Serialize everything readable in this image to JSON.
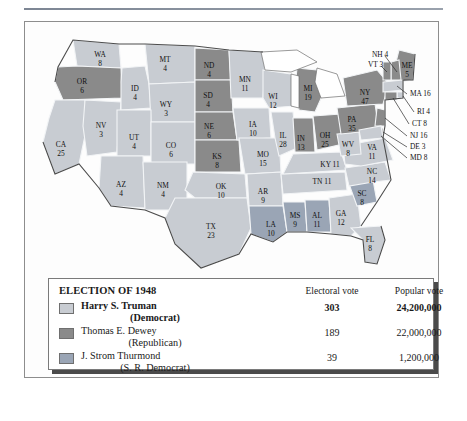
{
  "figure": {
    "legend_title": "ELECTION OF 1948",
    "col_electoral": "Electoral vote",
    "col_popular": "Popular vote",
    "candidates": [
      {
        "name": "Harry S. Truman",
        "party": "(Democrat)",
        "electoral": "303",
        "popular": "24,200,000",
        "color": "#c8ccd2"
      },
      {
        "name": "Thomas E. Dewey",
        "party": "(Republican)",
        "electoral": "189",
        "popular": "22,000,000",
        "color": "#8a8a8a"
      },
      {
        "name": "J. Strom Thurmond",
        "party": "(S. R. Democrat)",
        "electoral": "39",
        "popular": "1,200,000",
        "color": "#9aa5b5"
      }
    ]
  },
  "colors": {
    "truman": "#c8ccd2",
    "dewey": "#8a8a8a",
    "thurmond": "#9aa5b5",
    "water": "#ffffff",
    "border": "#f2f4f6",
    "coast": "#4c4c4c"
  },
  "chart_data": {
    "type": "map",
    "title": "ELECTION OF 1948",
    "legend_position": "bottom",
    "series": [
      {
        "name": "Harry S. Truman",
        "party": "Democrat",
        "electoral_vote": 303,
        "popular_vote": 24200000,
        "color": "#c8ccd2"
      },
      {
        "name": "Thomas E. Dewey",
        "party": "Republican",
        "electoral_vote": 189,
        "popular_vote": 22000000,
        "color": "#8a8a8a"
      },
      {
        "name": "J. Strom Thurmond",
        "party": "S. R. Democrat",
        "electoral_vote": 39,
        "popular_vote": 1200000,
        "color": "#9aa5b5"
      }
    ],
    "states": [
      {
        "code": "WA",
        "votes": 8,
        "winner": "truman"
      },
      {
        "code": "OR",
        "votes": 6,
        "winner": "dewey"
      },
      {
        "code": "CA",
        "votes": 25,
        "winner": "truman"
      },
      {
        "code": "NV",
        "votes": 3,
        "winner": "truman"
      },
      {
        "code": "ID",
        "votes": 4,
        "winner": "truman"
      },
      {
        "code": "MT",
        "votes": 4,
        "winner": "truman"
      },
      {
        "code": "WY",
        "votes": 3,
        "winner": "truman"
      },
      {
        "code": "UT",
        "votes": 4,
        "winner": "truman"
      },
      {
        "code": "AZ",
        "votes": 4,
        "winner": "truman"
      },
      {
        "code": "CO",
        "votes": 6,
        "winner": "truman"
      },
      {
        "code": "NM",
        "votes": 4,
        "winner": "truman"
      },
      {
        "code": "ND",
        "votes": 4,
        "winner": "dewey"
      },
      {
        "code": "SD",
        "votes": 4,
        "winner": "dewey"
      },
      {
        "code": "NE",
        "votes": 6,
        "winner": "dewey"
      },
      {
        "code": "KS",
        "votes": 8,
        "winner": "dewey"
      },
      {
        "code": "OK",
        "votes": 10,
        "winner": "truman"
      },
      {
        "code": "TX",
        "votes": 23,
        "winner": "truman"
      },
      {
        "code": "MN",
        "votes": 11,
        "winner": "truman"
      },
      {
        "code": "IA",
        "votes": 10,
        "winner": "truman"
      },
      {
        "code": "MO",
        "votes": 15,
        "winner": "truman"
      },
      {
        "code": "AR",
        "votes": 9,
        "winner": "truman"
      },
      {
        "code": "LA",
        "votes": 10,
        "winner": "thurmond"
      },
      {
        "code": "WI",
        "votes": 12,
        "winner": "truman"
      },
      {
        "code": "IL",
        "votes": 28,
        "winner": "truman"
      },
      {
        "code": "MS",
        "votes": 9,
        "winner": "thurmond"
      },
      {
        "code": "AL",
        "votes": 11,
        "winner": "thurmond"
      },
      {
        "code": "TN",
        "votes": 11,
        "winner": "truman"
      },
      {
        "code": "KY",
        "votes": 11,
        "winner": "truman"
      },
      {
        "code": "IN",
        "votes": 13,
        "winner": "dewey"
      },
      {
        "code": "MI",
        "votes": 19,
        "winner": "dewey"
      },
      {
        "code": "OH",
        "votes": 25,
        "winner": "dewey"
      },
      {
        "code": "GA",
        "votes": 12,
        "winner": "truman"
      },
      {
        "code": "FL",
        "votes": 8,
        "winner": "truman"
      },
      {
        "code": "SC",
        "votes": 8,
        "winner": "thurmond"
      },
      {
        "code": "NC",
        "votes": 14,
        "winner": "truman"
      },
      {
        "code": "VA",
        "votes": 11,
        "winner": "truman"
      },
      {
        "code": "WV",
        "votes": 8,
        "winner": "truman"
      },
      {
        "code": "PA",
        "votes": 35,
        "winner": "dewey"
      },
      {
        "code": "NY",
        "votes": 47,
        "winner": "dewey"
      },
      {
        "code": "ME",
        "votes": 5,
        "winner": "dewey"
      },
      {
        "code": "NH",
        "votes": 4,
        "winner": "dewey"
      },
      {
        "code": "VT",
        "votes": 3,
        "winner": "dewey"
      },
      {
        "code": "MA",
        "votes": 16,
        "winner": "truman"
      },
      {
        "code": "RI",
        "votes": 4,
        "winner": "truman"
      },
      {
        "code": "CT",
        "votes": 8,
        "winner": "dewey"
      },
      {
        "code": "NJ",
        "votes": 16,
        "winner": "dewey"
      },
      {
        "code": "DE",
        "votes": 3,
        "winner": "dewey"
      },
      {
        "code": "MD",
        "votes": 8,
        "winner": "truman"
      }
    ]
  },
  "map_labels": {
    "inside": [
      {
        "code": "WA",
        "votes": "8",
        "x": 75,
        "y": 33
      },
      {
        "code": "OR",
        "votes": "6",
        "x": 57,
        "y": 60
      },
      {
        "code": "CA",
        "votes": "25",
        "x": 36,
        "y": 123
      },
      {
        "code": "NV",
        "votes": "3",
        "x": 76,
        "y": 104
      },
      {
        "code": "ID",
        "votes": "4",
        "x": 110,
        "y": 67
      },
      {
        "code": "MT",
        "votes": "4",
        "x": 140,
        "y": 38
      },
      {
        "code": "WY",
        "votes": "3",
        "x": 141,
        "y": 83
      },
      {
        "code": "UT",
        "votes": "4",
        "x": 109,
        "y": 116
      },
      {
        "code": "AZ",
        "votes": "4",
        "x": 96,
        "y": 163
      },
      {
        "code": "CO",
        "votes": "6",
        "x": 146,
        "y": 124
      },
      {
        "code": "NM",
        "votes": "4",
        "x": 138,
        "y": 164
      },
      {
        "code": "ND",
        "votes": "4",
        "x": 184,
        "y": 44
      },
      {
        "code": "SD",
        "votes": "4",
        "x": 183,
        "y": 74
      },
      {
        "code": "NE",
        "votes": "6",
        "x": 184,
        "y": 105
      },
      {
        "code": "KS",
        "votes": "8",
        "x": 192,
        "y": 135
      },
      {
        "code": "OK",
        "votes": "10",
        "x": 196,
        "y": 165
      },
      {
        "code": "TX",
        "votes": "23",
        "x": 186,
        "y": 205
      },
      {
        "code": "MN",
        "votes": "11",
        "x": 220,
        "y": 58
      },
      {
        "code": "IA",
        "votes": "10",
        "x": 228,
        "y": 103
      },
      {
        "code": "MO",
        "votes": "15",
        "x": 238,
        "y": 133
      },
      {
        "code": "AR",
        "votes": "9",
        "x": 238,
        "y": 170
      },
      {
        "code": "LA",
        "votes": "10",
        "x": 246,
        "y": 203
      },
      {
        "code": "WI",
        "votes": "12",
        "x": 248,
        "y": 75
      },
      {
        "code": "IL",
        "votes": "28",
        "x": 258,
        "y": 114
      },
      {
        "code": "MS",
        "votes": "9",
        "x": 270,
        "y": 194
      },
      {
        "code": "AL",
        "votes": "11",
        "x": 292,
        "y": 194
      },
      {
        "code": "GA",
        "votes": "12",
        "x": 316,
        "y": 192
      },
      {
        "code": "FL",
        "votes": "8",
        "x": 345,
        "y": 218
      },
      {
        "code": "SC",
        "votes": "8",
        "x": 337,
        "y": 172
      },
      {
        "code": "NC",
        "votes": "14",
        "x": 347,
        "y": 150
      },
      {
        "code": "MI",
        "votes": "19",
        "x": 283,
        "y": 67
      },
      {
        "code": "IN",
        "votes": "13",
        "x": 276,
        "y": 117
      },
      {
        "code": "OH",
        "votes": "25",
        "x": 300,
        "y": 114
      },
      {
        "code": "PA",
        "votes": "35",
        "x": 327,
        "y": 98
      },
      {
        "code": "NY",
        "votes": "47",
        "x": 340,
        "y": 71
      },
      {
        "code": "ME",
        "votes": "5",
        "x": 382,
        "y": 44
      }
    ],
    "single_line_inside": [
      {
        "text": "TN 11",
        "x": 297,
        "y": 160
      },
      {
        "text": "KY 11",
        "x": 305,
        "y": 143
      },
      {
        "text": "WV",
        "x": 323,
        "y": 123
      },
      {
        "text": "8",
        "x": 323,
        "y": 132
      },
      {
        "text": "VA",
        "x": 347,
        "y": 126
      },
      {
        "text": "11",
        "x": 347,
        "y": 135
      }
    ],
    "outside": [
      {
        "text": "NH 4",
        "x": 347,
        "y": 33
      },
      {
        "text": "VT 3",
        "x": 343,
        "y": 43
      },
      {
        "text": "MA 16",
        "x": 385,
        "y": 72
      },
      {
        "text": "RI 4",
        "x": 392,
        "y": 90
      },
      {
        "text": "CT 8",
        "x": 387,
        "y": 102
      },
      {
        "text": "NJ 16",
        "x": 385,
        "y": 114
      },
      {
        "text": "DE 3",
        "x": 385,
        "y": 125
      },
      {
        "text": "MD 8",
        "x": 385,
        "y": 136
      }
    ]
  }
}
